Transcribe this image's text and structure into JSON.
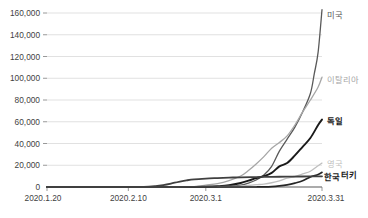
{
  "chart_data": {
    "type": "line",
    "title": "",
    "xlabel": "",
    "ylabel": "",
    "ylim": [
      0,
      160000
    ],
    "xlim": [
      "2020.1.20",
      "2020.3.31"
    ],
    "grid": true,
    "legend_position": "right-inline-labels",
    "y_ticks": [
      "0",
      "20,000",
      "40,000",
      "60,000",
      "80,000",
      "100,000",
      "120,000",
      "140,000",
      "160,000"
    ],
    "y_tick_values": [
      0,
      20000,
      40000,
      60000,
      80000,
      100000,
      120000,
      140000,
      160000
    ],
    "x_ticks": [
      "2020.1.20",
      "2020.2.10",
      "2020.3.1",
      "2020.3.31"
    ],
    "x_tick_days": [
      0,
      21,
      41,
      71
    ],
    "x_days_total": 71,
    "series": [
      {
        "name": "미국",
        "label": "미국",
        "color": "#595959",
        "bold": false,
        "width": 1.3,
        "end_value": 163000,
        "label_y_value": 158000,
        "x": [
          0,
          10,
          20,
          28,
          34,
          38,
          41,
          44,
          47,
          50,
          52,
          54,
          56,
          58,
          60,
          62,
          64,
          66,
          68,
          69,
          70,
          71
        ],
        "values": [
          0,
          5,
          12,
          15,
          35,
          70,
          120,
          250,
          600,
          1700,
          3500,
          6400,
          11000,
          19000,
          33000,
          44000,
          55000,
          69000,
          86000,
          104000,
          124000,
          163000
        ]
      },
      {
        "name": "이탈리아",
        "label": "이탈리아",
        "color": "#a6a6a6",
        "bold": false,
        "width": 1.3,
        "end_value": 101000,
        "label_y_value": 98000,
        "x": [
          0,
          10,
          20,
          28,
          34,
          38,
          41,
          44,
          47,
          50,
          52,
          54,
          56,
          58,
          60,
          62,
          64,
          66,
          68,
          70,
          71
        ],
        "values": [
          0,
          2,
          3,
          3,
          20,
          400,
          1700,
          3100,
          5900,
          10100,
          15100,
          21200,
          27900,
          35700,
          41000,
          47000,
          57000,
          69000,
          80000,
          92000,
          101000
        ]
      },
      {
        "name": "독일",
        "label": "독일",
        "color": "#1a1a1a",
        "bold": true,
        "width": 1.9,
        "end_value": 62000,
        "label_y_value": 61000,
        "x": [
          0,
          10,
          20,
          28,
          34,
          38,
          41,
          44,
          47,
          50,
          52,
          54,
          56,
          58,
          60,
          62,
          64,
          66,
          68,
          70,
          71
        ],
        "values": [
          0,
          1,
          14,
          16,
          18,
          60,
          200,
          700,
          1600,
          3700,
          5800,
          8200,
          10000,
          13000,
          19000,
          22000,
          29000,
          37000,
          45000,
          57000,
          62000
        ]
      },
      {
        "name": "영국",
        "label": "영국",
        "color": "#bfbfbf",
        "bold": false,
        "width": 1.3,
        "end_value": 22000,
        "label_y_value": 22500,
        "x": [
          0,
          10,
          20,
          28,
          34,
          38,
          41,
          44,
          47,
          50,
          52,
          54,
          56,
          58,
          60,
          62,
          64,
          66,
          68,
          70,
          71
        ],
        "values": [
          0,
          0,
          2,
          9,
          13,
          23,
          85,
          210,
          460,
          800,
          1400,
          2100,
          2700,
          3900,
          5700,
          8100,
          9500,
          12000,
          14500,
          19500,
          22000
        ]
      },
      {
        "name": "터키",
        "label": "터키",
        "color": "#262626",
        "bold": true,
        "width": 1.7,
        "end_value": 13500,
        "label_y_value": 13000,
        "x": [
          0,
          20,
          40,
          48,
          52,
          54,
          56,
          58,
          60,
          62,
          64,
          66,
          68,
          70,
          71
        ],
        "values": [
          0,
          0,
          0,
          0,
          1,
          18,
          100,
          360,
          1000,
          2000,
          3600,
          5700,
          9200,
          11500,
          13500
        ]
      },
      {
        "name": "한국",
        "label": "한국",
        "color": "#404040",
        "bold": true,
        "width": 1.8,
        "end_value": 9790,
        "label_y_value": 8200,
        "x": [
          0,
          8,
          14,
          20,
          25,
          28,
          30,
          32,
          34,
          36,
          38,
          41,
          44,
          47,
          50,
          54,
          58,
          62,
          66,
          71
        ],
        "values": [
          1,
          24,
          28,
          31,
          104,
          833,
          1766,
          3150,
          4812,
          6088,
          7041,
          7755,
          8236,
          8652,
          8897,
          9137,
          9332,
          9478,
          9661,
          9790
        ]
      }
    ]
  },
  "axis": {
    "baseline_color": "#595959",
    "gridline_color": "#d9d9d9",
    "tick_color": "#7f7f7f",
    "text_color": "#3f3f3f"
  }
}
